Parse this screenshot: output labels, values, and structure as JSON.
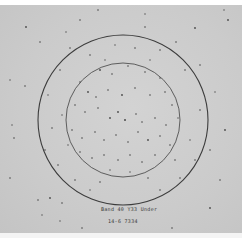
{
  "image": {
    "description": "Grayscale photograph of a speckled plate showing scattered dots with two concentric circles drawn on it and handwritten annotation near the bottom",
    "background_color": "#cbcbcb",
    "circle_color": "#3c3c3c",
    "dot_color": "#4a4a4a",
    "circles": [
      {
        "name": "outer",
        "cx": 123,
        "cy": 120,
        "r": 85
      },
      {
        "name": "inner",
        "cx": 123,
        "cy": 120,
        "r": 57
      }
    ]
  },
  "annotation": {
    "line1": "Band 40 Y33 Under",
    "line2": "14-6    7334"
  }
}
